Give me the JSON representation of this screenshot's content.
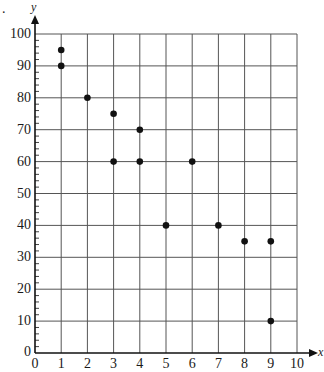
{
  "question_marker": ".",
  "chart_data": {
    "type": "scatter",
    "title": "",
    "xlabel": "x",
    "ylabel": "y",
    "xlim": [
      0,
      10
    ],
    "ylim": [
      0,
      100
    ],
    "x_ticks": [
      "0",
      "1",
      "2",
      "3",
      "4",
      "5",
      "6",
      "7",
      "8",
      "9",
      "10"
    ],
    "y_ticks": [
      "0",
      "10",
      "20",
      "30",
      "40",
      "50",
      "60",
      "70",
      "80",
      "90",
      "100"
    ],
    "y_ticks_display": [
      "10",
      "20",
      "30",
      "40",
      "50",
      "60",
      "70",
      "80",
      "90",
      "100"
    ],
    "y_minor_tick_step": 2,
    "grid": true,
    "legend": null,
    "points": [
      {
        "x": 1,
        "y": 95
      },
      {
        "x": 1,
        "y": 90
      },
      {
        "x": 2,
        "y": 80
      },
      {
        "x": 3,
        "y": 75
      },
      {
        "x": 3,
        "y": 60
      },
      {
        "x": 4,
        "y": 70
      },
      {
        "x": 4,
        "y": 60
      },
      {
        "x": 5,
        "y": 40
      },
      {
        "x": 6,
        "y": 60
      },
      {
        "x": 7,
        "y": 40
      },
      {
        "x": 8,
        "y": 35
      },
      {
        "x": 9,
        "y": 35
      },
      {
        "x": 9,
        "y": 10
      }
    ]
  },
  "colors": {
    "grid": "#555555",
    "axis": "#111111",
    "point": "#111111"
  }
}
